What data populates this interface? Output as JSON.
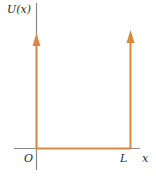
{
  "diagram": {
    "type": "infinite-square-well-potential",
    "y_axis_label": "U(x)",
    "x_axis_label": "x",
    "origin_label": "O",
    "well_edge_label": "L",
    "colors": {
      "axes": "#8a8a8a",
      "potential": "#d9893f",
      "text": "#2a2a2a",
      "background": "#ffffff"
    },
    "geometry": {
      "origin": [
        36,
        148
      ],
      "well_right_x": 130,
      "left_wall_arrow_tip_y": 34,
      "right_wall_arrow_tip_y": 31
    }
  }
}
